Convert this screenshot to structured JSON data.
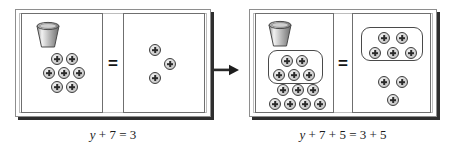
{
  "figure": {
    "arrow": {
      "icon": "right-arrow-icon",
      "label": "then"
    }
  },
  "steps": [
    {
      "id": "step-1",
      "equation": {
        "variable": "y",
        "text": "y + 7 = 3",
        "rest": " + 7 = 3"
      },
      "operator": "=",
      "left_panel": {
        "name": "left-panel",
        "bucket": {
          "icon": "bucket-icon",
          "label": "y"
        },
        "counter_count": 7,
        "group_outline": false,
        "counters": [
          {
            "x": 29,
            "y": 39
          },
          {
            "x": 44,
            "y": 39
          },
          {
            "x": 21,
            "y": 53
          },
          {
            "x": 36,
            "y": 53
          },
          {
            "x": 51,
            "y": 53
          },
          {
            "x": 29,
            "y": 67
          },
          {
            "x": 44,
            "y": 67
          }
        ]
      },
      "right_panel": {
        "name": "right-panel",
        "counter_count": 3,
        "group_outline": false,
        "counters": [
          {
            "x": 25,
            "y": 30
          },
          {
            "x": 40,
            "y": 44
          },
          {
            "x": 25,
            "y": 58
          }
        ]
      }
    },
    {
      "id": "step-2",
      "equation": {
        "variable": "y",
        "text": "y + 7 + 5 = 3 + 5",
        "rest": " + 7 + 5 = 3 + 5"
      },
      "operator": "=",
      "left_panel": {
        "name": "left-panel",
        "bucket": {
          "icon": "bucket-icon",
          "label": "y"
        },
        "counter_count": 12,
        "group_outline": true,
        "group_label": "added-counters-group",
        "counters": [
          {
            "x": 25,
            "y": 41
          },
          {
            "x": 40,
            "y": 41
          },
          {
            "x": 17,
            "y": 55
          },
          {
            "x": 32,
            "y": 55
          },
          {
            "x": 47,
            "y": 55
          },
          {
            "x": 21,
            "y": 70
          },
          {
            "x": 36,
            "y": 70
          },
          {
            "x": 51,
            "y": 70
          },
          {
            "x": 13,
            "y": 84
          },
          {
            "x": 28,
            "y": 84
          },
          {
            "x": 43,
            "y": 84
          },
          {
            "x": 58,
            "y": 84
          }
        ]
      },
      "right_panel": {
        "name": "right-panel",
        "counter_count": 8,
        "group_outline": true,
        "group_label": "added-counters-group",
        "counters": [
          {
            "x": 25,
            "y": 18
          },
          {
            "x": 43,
            "y": 18
          },
          {
            "x": 16,
            "y": 34
          },
          {
            "x": 34,
            "y": 34
          },
          {
            "x": 52,
            "y": 34
          },
          {
            "x": 25,
            "y": 62
          },
          {
            "x": 43,
            "y": 62
          },
          {
            "x": 34,
            "y": 80
          }
        ]
      }
    }
  ]
}
